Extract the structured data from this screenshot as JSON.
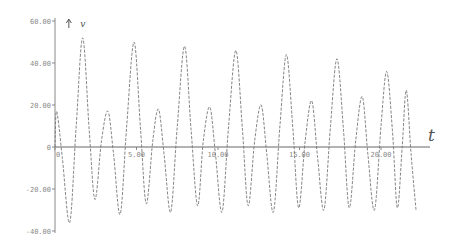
{
  "chart_data": {
    "type": "line",
    "title": "",
    "xlabel": "t",
    "ylabel": "v",
    "xlim": [
      0,
      20
    ],
    "ylim": [
      -40,
      60
    ],
    "grid": false,
    "legend": null,
    "x_ticks": [
      {
        "value": 0,
        "label": "0"
      },
      {
        "value": 5,
        "label": "5.00"
      },
      {
        "value": 10,
        "label": "10.00"
      },
      {
        "value": 15,
        "label": "15.00"
      },
      {
        "value": 20,
        "label": "20.00"
      }
    ],
    "y_ticks": [
      {
        "value": 60,
        "label": "60.00"
      },
      {
        "value": 40,
        "label": "40.00"
      },
      {
        "value": 20,
        "label": "20.00"
      },
      {
        "value": 0,
        "label": "0"
      },
      {
        "value": -20,
        "label": "-20.00"
      },
      {
        "value": -40,
        "label": "-40.00"
      }
    ],
    "annotations": [
      {
        "text": "v",
        "position": "top-left near y-axis arrow"
      },
      {
        "text": "t",
        "position": "right end of x-axis"
      }
    ],
    "series": [
      {
        "name": "v(t)",
        "style": "dashed",
        "color": "#777777",
        "points": [
          [
            0.0,
            0
          ],
          [
            0.1,
            17
          ],
          [
            0.45,
            -5
          ],
          [
            0.9,
            -36
          ],
          [
            1.3,
            10
          ],
          [
            1.7,
            52
          ],
          [
            2.1,
            8
          ],
          [
            2.45,
            -25
          ],
          [
            2.85,
            3
          ],
          [
            3.25,
            17
          ],
          [
            3.6,
            -4
          ],
          [
            4.0,
            -32
          ],
          [
            4.4,
            10
          ],
          [
            4.85,
            50
          ],
          [
            5.25,
            8
          ],
          [
            5.6,
            -27
          ],
          [
            6.0,
            3
          ],
          [
            6.35,
            18
          ],
          [
            6.7,
            -4
          ],
          [
            7.1,
            -31
          ],
          [
            7.5,
            10
          ],
          [
            7.95,
            48
          ],
          [
            8.35,
            8
          ],
          [
            8.75,
            -28
          ],
          [
            9.1,
            3
          ],
          [
            9.5,
            19
          ],
          [
            9.85,
            -4
          ],
          [
            10.25,
            -31
          ],
          [
            10.65,
            10
          ],
          [
            11.1,
            46
          ],
          [
            11.5,
            8
          ],
          [
            11.85,
            -28
          ],
          [
            12.25,
            3
          ],
          [
            12.65,
            20
          ],
          [
            13.0,
            -4
          ],
          [
            13.4,
            -31
          ],
          [
            13.8,
            10
          ],
          [
            14.2,
            44
          ],
          [
            14.6,
            8
          ],
          [
            14.95,
            -29
          ],
          [
            15.35,
            3
          ],
          [
            15.75,
            22
          ],
          [
            16.1,
            -4
          ],
          [
            16.5,
            -30
          ],
          [
            16.9,
            10
          ],
          [
            17.3,
            42
          ],
          [
            17.7,
            8
          ],
          [
            18.05,
            -29
          ],
          [
            18.45,
            3
          ],
          [
            18.85,
            24
          ],
          [
            19.2,
            -4
          ],
          [
            19.6,
            -30
          ],
          [
            20.0,
            10
          ],
          [
            20.35,
            36
          ],
          [
            20.7,
            8
          ],
          [
            21.0,
            -29
          ],
          [
            21.3,
            0
          ],
          [
            21.55,
            27
          ],
          [
            21.85,
            -4
          ],
          [
            22.15,
            -30
          ]
        ]
      }
    ]
  },
  "plot_area": {
    "origin_px": [
      55,
      147
    ],
    "x_px_per_unit": 16.3,
    "y_px_per_unit": 2.1,
    "x_axis_end_px": 430,
    "y_axis_top_px": 18,
    "y_axis_bottom_px": 233
  }
}
